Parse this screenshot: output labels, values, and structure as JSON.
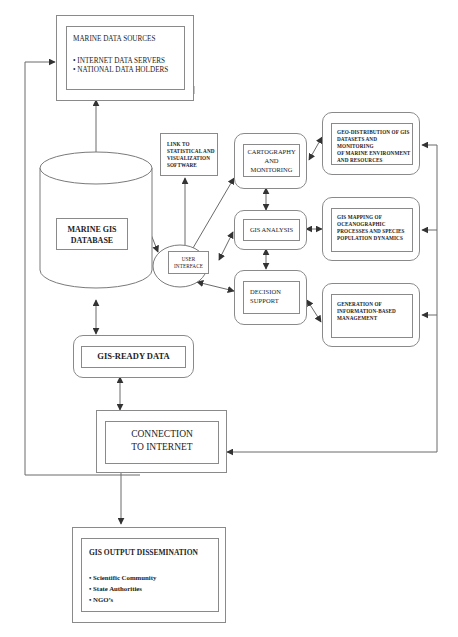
{
  "diagram": {
    "marine_data_sources": {
      "title": "MARINE DATA SOURCES",
      "items": [
        "INTERNET DATA SERVERS",
        "NATIONAL DATA HOLDERS"
      ]
    },
    "database": {
      "label_line1": "MARINE GIS",
      "label_line2": "DATABASE"
    },
    "link_software": {
      "line1": "LINK TO",
      "line2": "STATISTICAL AND",
      "line3": "VISUALIZATION",
      "line4": "SOFTWARE"
    },
    "user_interface": {
      "line1": "USER",
      "line2": "INTERFACE"
    },
    "cartography": {
      "line1": "CARTOGRAPHY",
      "line2": "AND",
      "line3": "MONITORING"
    },
    "gis_analysis": {
      "label": "GIS ANALYSIS"
    },
    "decision_support": {
      "line1": "DECISION",
      "line2": "SUPPORT"
    },
    "geo_distribution": {
      "line1": "GEO-DISTRIBUTION OF GIS",
      "line2": "DATASETS AND MONITORING",
      "line3": "OF MARINE ENVIRONMENT",
      "line4": "AND RESOURCES"
    },
    "gis_mapping": {
      "line1": "GIS MAPPING OF",
      "line2": "OCEANOGRAPHIC",
      "line3": "PROCESSES AND SPECIES",
      "line4": "POPULATION DYNAMICS"
    },
    "info_management": {
      "line1": "GENERATION OF",
      "line2": "INFORMATION-BASED",
      "line3": "MANAGEMENT"
    },
    "gis_ready": {
      "label": "GIS-READY DATA"
    },
    "connection": {
      "line1": "CONNECTION",
      "line2": "TO INTERNET"
    },
    "output": {
      "title": "GIS OUTPUT DISSEMINATION",
      "items": [
        "Scientific Community",
        "State Authorities",
        "NGO’s"
      ]
    },
    "colors": {
      "line": "#6a6a6a",
      "border": "#8a8a8a",
      "text": "#222222"
    }
  }
}
